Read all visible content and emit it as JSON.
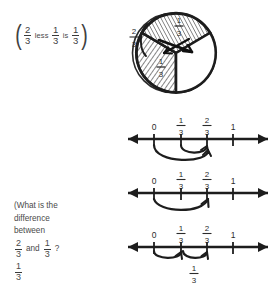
{
  "page": {
    "background_color": "#ffffff",
    "ink_color": "#2b2b2b",
    "text_color": "#4a4a4a"
  },
  "expression": {
    "open_paren": "(",
    "close_paren": ")",
    "first_fraction": {
      "numerator": "2",
      "denominator": "3"
    },
    "connector_1": "less",
    "second_fraction": {
      "numerator": "1",
      "denominator": "3"
    },
    "connector_2": "is",
    "result_fraction": {
      "numerator": "1",
      "denominator": "3"
    }
  },
  "question": {
    "line_1": "(What is the",
    "line_2": "difference",
    "line_3": "between",
    "fraction_a": {
      "numerator": "2",
      "denominator": "3"
    },
    "conjunction": "and",
    "fraction_b": {
      "numerator": "1",
      "denominator": "3"
    },
    "question_mark": "?",
    "answer_fraction": {
      "numerator": "1",
      "denominator": "3"
    }
  },
  "circle_diagram": {
    "name": "fraction-circle-thirds",
    "outer_label": {
      "numerator": "2",
      "denominator": "3"
    },
    "sectors": [
      {
        "id": "top-sector",
        "label": {
          "numerator": "1",
          "denominator": "3"
        },
        "shaded": true,
        "crossed_out": true
      },
      {
        "id": "left-sector",
        "label": {
          "numerator": "1",
          "denominator": "3"
        },
        "shaded": true,
        "crossed_out": false
      },
      {
        "id": "right-sector",
        "label": null,
        "shaded": false,
        "crossed_out": false
      }
    ]
  },
  "number_lines": [
    {
      "id": "number-line-1",
      "ticks": [
        {
          "value": "0",
          "type": "whole"
        },
        {
          "value": "1/3",
          "numerator": "1",
          "denominator": "3",
          "type": "fraction"
        },
        {
          "value": "2/3",
          "numerator": "2",
          "denominator": "3",
          "type": "fraction"
        },
        {
          "value": "1",
          "type": "whole"
        }
      ],
      "arcs": [
        {
          "from": "0",
          "to": "2/3",
          "direction": "right",
          "size": "large"
        },
        {
          "from": "1/3",
          "to": "2/3",
          "direction": "right",
          "size": "small"
        }
      ],
      "below_label": null
    },
    {
      "id": "number-line-2",
      "ticks": [
        {
          "value": "0",
          "type": "whole"
        },
        {
          "value": "1/3",
          "numerator": "1",
          "denominator": "3",
          "type": "fraction"
        },
        {
          "value": "2/3",
          "numerator": "2",
          "denominator": "3",
          "type": "fraction"
        },
        {
          "value": "1",
          "type": "whole"
        }
      ],
      "arcs": [
        {
          "from": "0",
          "to": "2/3",
          "direction": "right",
          "size": "large"
        }
      ],
      "below_label": null
    },
    {
      "id": "number-line-3",
      "ticks": [
        {
          "value": "0",
          "type": "whole"
        },
        {
          "value": "1/3",
          "numerator": "1",
          "denominator": "3",
          "type": "fraction"
        },
        {
          "value": "2/3",
          "numerator": "2",
          "denominator": "3",
          "type": "fraction"
        },
        {
          "value": "1",
          "type": "whole"
        }
      ],
      "arcs": [
        {
          "from": "0",
          "to": "1/3",
          "direction": "right",
          "size": "hop"
        },
        {
          "from": "1/3",
          "to": "2/3",
          "direction": "right",
          "size": "hop"
        }
      ],
      "below_label": {
        "numerator": "1",
        "denominator": "3"
      }
    }
  ]
}
